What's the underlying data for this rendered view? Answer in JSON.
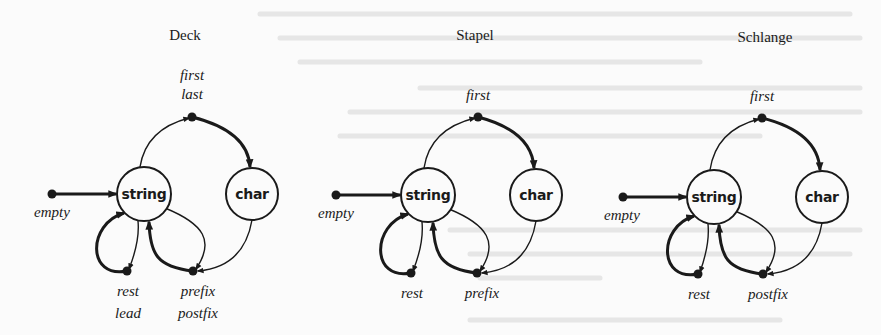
{
  "figure": {
    "type": "state-diagram",
    "colors": {
      "ink": "#1a1a1a",
      "paper": "#fbfbfb",
      "bleed": "#d9d9d9"
    },
    "panels": [
      {
        "id": "deck",
        "title": "Deck",
        "title_pos": [
          185,
          40
        ],
        "nodes": {
          "string": {
            "label": "string",
            "cx": 144,
            "cy": 194,
            "r": 27
          },
          "char": {
            "label": "char",
            "cx": 252,
            "cy": 194,
            "r": 26
          }
        },
        "start": {
          "label": "empty",
          "x": 52,
          "y": 194,
          "label_pos": [
            52,
            217
          ]
        },
        "top_dot": {
          "x": 192,
          "y": 117,
          "labels": [
            "first",
            "last"
          ],
          "label_pos": [
            192,
            80
          ]
        },
        "left_dot": {
          "x": 127,
          "y": 271,
          "labels": [
            "rest",
            "lead"
          ],
          "label_pos": [
            128,
            296
          ]
        },
        "right_dot": {
          "x": 193,
          "y": 271,
          "labels": [
            "prefix",
            "postfix"
          ],
          "label_pos": [
            198,
            296
          ]
        }
      },
      {
        "id": "stapel",
        "title": "Stapel",
        "title_pos": [
          475,
          40
        ],
        "nodes": {
          "string": {
            "label": "string",
            "cx": 428,
            "cy": 195,
            "r": 27
          },
          "char": {
            "label": "char",
            "cx": 536,
            "cy": 195,
            "r": 26
          }
        },
        "start": {
          "label": "empty",
          "x": 336,
          "y": 195,
          "label_pos": [
            336,
            218
          ]
        },
        "top_dot": {
          "x": 478,
          "y": 117,
          "labels": [
            "first"
          ],
          "label_pos": [
            478,
            100
          ]
        },
        "left_dot": {
          "x": 411,
          "y": 273,
          "labels": [
            "rest"
          ],
          "label_pos": [
            412,
            298
          ]
        },
        "right_dot": {
          "x": 477,
          "y": 273,
          "labels": [
            "prefix"
          ],
          "label_pos": [
            482,
            298
          ]
        }
      },
      {
        "id": "schlange",
        "title": "Schlange",
        "title_pos": [
          765,
          42
        ],
        "nodes": {
          "string": {
            "label": "string",
            "cx": 714,
            "cy": 197,
            "r": 27
          },
          "char": {
            "label": "char",
            "cx": 822,
            "cy": 197,
            "r": 26
          }
        },
        "start": {
          "label": "empty",
          "x": 623,
          "y": 197,
          "label_pos": [
            622,
            220
          ]
        },
        "top_dot": {
          "x": 762,
          "y": 118,
          "labels": [
            "first"
          ],
          "label_pos": [
            762,
            101
          ]
        },
        "left_dot": {
          "x": 698,
          "y": 274,
          "labels": [
            "rest"
          ],
          "label_pos": [
            699,
            299
          ]
        },
        "right_dot": {
          "x": 763,
          "y": 274,
          "labels": [
            "postfix"
          ],
          "label_pos": [
            768,
            299
          ]
        }
      }
    ]
  }
}
